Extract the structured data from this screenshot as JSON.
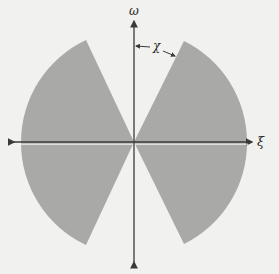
{
  "figure": {
    "type": "wedge-region-diagram",
    "colors": {
      "background": "#f1f1ef",
      "shaded_region": "#a9a9a7",
      "axes": "#3a3a3a",
      "text": "#2a2a2a"
    },
    "axes": {
      "horizontal_label": "ξ",
      "vertical_label": "ω",
      "origin_px": [
        134,
        142
      ]
    },
    "angle_label": "χ",
    "region": {
      "radius_px": 113,
      "sectors": [
        {
          "name": "upper-left",
          "from_axis": "negative-xi",
          "to_tip_px": [
            86,
            40
          ]
        },
        {
          "name": "upper-right",
          "from_axis": "positive-xi",
          "to_tip_px": [
            184,
            41
          ]
        },
        {
          "name": "lower-left",
          "from_axis": "negative-xi",
          "to_tip_px": [
            86,
            247
          ]
        },
        {
          "name": "lower-right",
          "from_axis": "positive-xi",
          "to_tip_px": [
            184,
            246
          ]
        }
      ]
    }
  }
}
